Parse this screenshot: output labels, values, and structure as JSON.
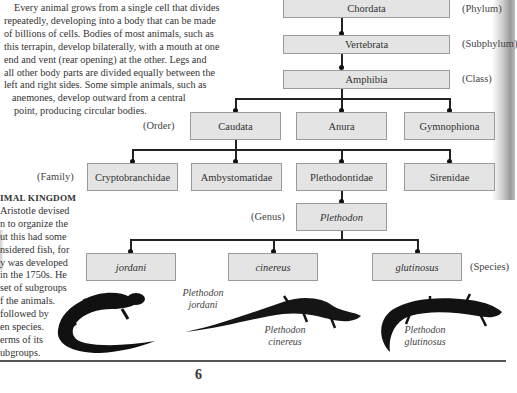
{
  "intro_lines": [
    "Every animal grows from a single cell that divides",
    "repeatedly, developing into a body that can be made",
    "of billions of cells. Bodies of most animals, such as",
    "this terrapin, develop bilaterally, with a mouth at one",
    "end and vent (rear opening) at the other. Legs and",
    "all other body parts are divided equally between the",
    "left and right sides. Some simple animals, such as",
    "anemones, develop outward from a central",
    "point, producing circular bodies."
  ],
  "sidebar": {
    "heading": "IMAL KINGDOM",
    "lines": [
      "Aristotle devised",
      "n to organize the",
      "ut this had some",
      "nsidered fish, for",
      "y was developed",
      "in the 1750s. He",
      "set of subgroups",
      "f the animals.",
      "followed by",
      "en species.",
      "erms of its",
      "ubgroups."
    ]
  },
  "taxonomy": {
    "phylum": {
      "name": "Chordata",
      "rank": "(Phylum)"
    },
    "subphylum": {
      "name": "Vertebrata",
      "rank": "(Subphylum)"
    },
    "class": {
      "name": "Amphibia",
      "rank": "(Class)"
    },
    "order": {
      "rank": "(Order)",
      "items": [
        "Caudata",
        "Anura",
        "Gymnophiona"
      ]
    },
    "family": {
      "rank": "(Family)",
      "items": [
        "Cryptobranchidae",
        "Ambystomatidae",
        "Plethodontidae",
        "Sirenidae"
      ]
    },
    "genus": {
      "name": "Plethodon",
      "rank": "(Genus)"
    },
    "species": {
      "rank": "(Species)",
      "items": [
        "jordani",
        "cinereus",
        "glutinosus"
      ]
    }
  },
  "captions": [
    {
      "genus": "Plethodon",
      "species": "jordani"
    },
    {
      "genus": "Plethodon",
      "species": "cinereus"
    },
    {
      "genus": "Plethodon",
      "species": "glutinosus"
    }
  ],
  "page_number": "6"
}
